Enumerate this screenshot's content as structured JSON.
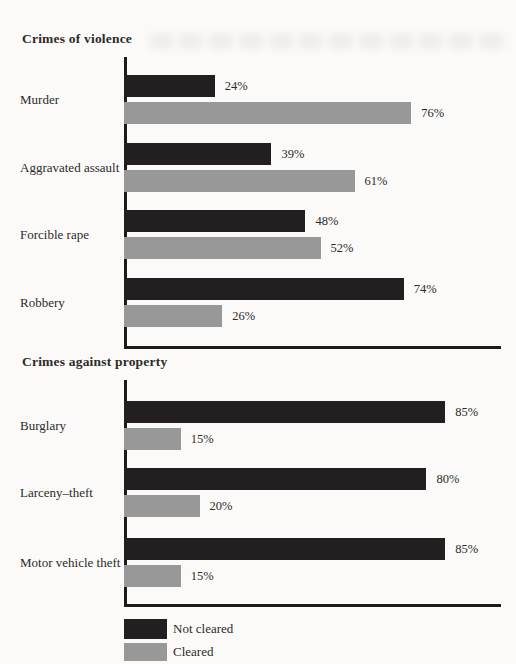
{
  "colors": {
    "not_cleared": "#231f20",
    "cleared": "#989898",
    "axis": "#1b1b1b",
    "background": "#fbfaf8",
    "text": "#2b2a28"
  },
  "legend": {
    "items": [
      {
        "label": "Not cleared",
        "color": "#231f20"
      },
      {
        "label": "Cleared",
        "color": "#989898"
      }
    ]
  },
  "chart_data": {
    "type": "bar",
    "orientation": "horizontal",
    "value_suffix": "%",
    "xlim": [
      0,
      100
    ],
    "grid": false,
    "legend_position": "bottom-left",
    "series_names": [
      "Not cleared",
      "Cleared"
    ],
    "groups": [
      {
        "title": "Crimes of violence",
        "categories": [
          "Murder",
          "Aggravated assault",
          "Forcible rape",
          "Robbery"
        ],
        "series": [
          {
            "name": "Not cleared",
            "values": [
              24,
              39,
              48,
              74
            ]
          },
          {
            "name": "Cleared",
            "values": [
              76,
              61,
              52,
              26
            ]
          }
        ]
      },
      {
        "title": "Crimes against property",
        "categories": [
          "Burglary",
          "Larceny–theft",
          "Motor vehicle theft"
        ],
        "series": [
          {
            "name": "Not cleared",
            "values": [
              85,
              80,
              85
            ]
          },
          {
            "name": "Cleared",
            "values": [
              15,
              20,
              15
            ]
          }
        ]
      }
    ]
  }
}
